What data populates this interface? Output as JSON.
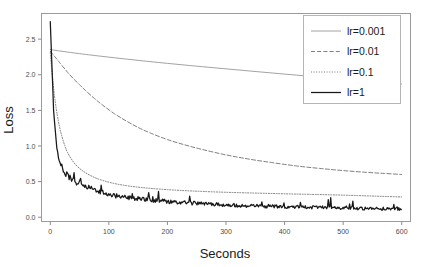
{
  "chart_data": {
    "type": "line",
    "title": "",
    "xlabel": "Seconds",
    "ylabel": "Loss",
    "xlim": [
      -15,
      615
    ],
    "ylim": [
      -0.06,
      2.86
    ],
    "xticks": [
      0,
      100,
      200,
      300,
      400,
      500,
      600
    ],
    "xtick_labels": [
      "0",
      "100",
      "200",
      "300",
      "400",
      "500",
      "600"
    ],
    "yticks": [
      0.0,
      0.5,
      1.0,
      1.5,
      2.0,
      2.5
    ],
    "ytick_labels": [
      "0.0",
      "0.5",
      "1.0",
      "1.5",
      "2.0",
      "2.5"
    ],
    "grid": false,
    "legend_position": "top-right",
    "x": [
      0,
      2,
      5,
      8,
      12,
      16,
      20,
      25,
      30,
      40,
      50,
      60,
      75,
      90,
      110,
      130,
      150,
      170,
      200,
      230,
      260,
      300,
      340,
      380,
      420,
      460,
      500,
      540,
      570,
      600
    ],
    "series": [
      {
        "name": "lr=0.001",
        "label": "lr=0.001",
        "style": "solid-thin",
        "color": "#8a8a8a",
        "width": 0.8,
        "dash": "",
        "values": [
          2.355,
          2.352,
          2.348,
          2.344,
          2.339,
          2.334,
          2.33,
          2.324,
          2.318,
          2.307,
          2.296,
          2.286,
          2.271,
          2.257,
          2.238,
          2.22,
          2.202,
          2.185,
          2.16,
          2.136,
          2.113,
          2.083,
          2.053,
          2.024,
          1.995,
          1.966,
          1.938,
          1.91,
          1.89,
          1.87
        ]
      },
      {
        "name": "lr=0.01",
        "label": "lr=0.01",
        "style": "dashed",
        "color": "#6f6f6f",
        "width": 0.9,
        "dash": "4,2.2",
        "values": [
          2.33,
          2.31,
          2.28,
          2.25,
          2.21,
          2.17,
          2.13,
          2.08,
          2.03,
          1.94,
          1.86,
          1.78,
          1.67,
          1.57,
          1.45,
          1.35,
          1.26,
          1.185,
          1.09,
          1.015,
          0.95,
          0.875,
          0.815,
          0.765,
          0.72,
          0.685,
          0.655,
          0.63,
          0.615,
          0.6
        ]
      },
      {
        "name": "lr=0.1",
        "label": "lr=0.1",
        "style": "dotted",
        "color": "#6f6f6f",
        "width": 0.9,
        "dash": "1,1.6",
        "values": [
          2.31,
          2.12,
          1.86,
          1.65,
          1.43,
          1.26,
          1.13,
          1.0,
          0.9,
          0.77,
          0.685,
          0.625,
          0.56,
          0.515,
          0.472,
          0.443,
          0.422,
          0.406,
          0.387,
          0.373,
          0.362,
          0.35,
          0.341,
          0.333,
          0.325,
          0.318,
          0.31,
          0.3,
          0.292,
          0.285
        ]
      },
      {
        "name": "lr=1",
        "label": "lr=1",
        "style": "solid-thick",
        "color": "#171717",
        "width": 1.25,
        "dash": "",
        "values": [
          2.75,
          2.3,
          1.62,
          1.22,
          0.92,
          0.78,
          0.7,
          0.62,
          0.57,
          0.5,
          0.46,
          0.425,
          0.385,
          0.345,
          0.3,
          0.275,
          0.255,
          0.24,
          0.218,
          0.2,
          0.186,
          0.17,
          0.158,
          0.148,
          0.14,
          0.133,
          0.127,
          0.122,
          0.118,
          0.115
        ]
      }
    ],
    "noise_series": "lr=1",
    "spikes": [
      {
        "x": 30,
        "y": 0.64
      },
      {
        "x": 33,
        "y": 0.56
      },
      {
        "x": 50,
        "y": 0.54
      },
      {
        "x": 88,
        "y": 0.38
      },
      {
        "x": 108,
        "y": 0.34
      },
      {
        "x": 140,
        "y": 0.33
      },
      {
        "x": 150,
        "y": 0.3
      },
      {
        "x": 168,
        "y": 0.345
      },
      {
        "x": 236,
        "y": 0.245
      },
      {
        "x": 372,
        "y": 0.2
      },
      {
        "x": 440,
        "y": 0.16
      },
      {
        "x": 520,
        "y": 0.16
      },
      {
        "x": 592,
        "y": 0.155
      }
    ]
  },
  "legend": {
    "entries": [
      "lr=0.001",
      "lr=0.01",
      "lr=0.1",
      "lr=1"
    ]
  },
  "axes": {
    "x_title": "Seconds",
    "y_title": "Loss"
  }
}
